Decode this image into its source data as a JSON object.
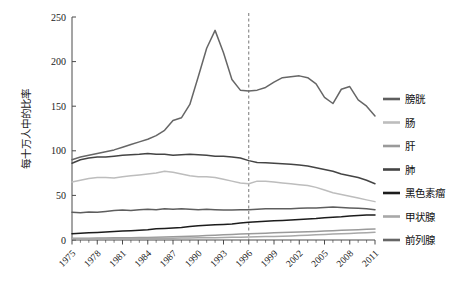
{
  "chart_data": {
    "type": "line",
    "title": "",
    "xlabel": "",
    "ylabel": "每十万人中的比率",
    "xlim": [
      1975,
      2011
    ],
    "ylim": [
      0,
      250
    ],
    "yticks": [
      0,
      50,
      100,
      150,
      200,
      250
    ],
    "xticks": [
      1975,
      1978,
      1981,
      1984,
      1987,
      1990,
      1993,
      1996,
      1999,
      2002,
      2005,
      2008,
      2011
    ],
    "xticklabels": [
      "1975",
      "1978",
      "1981",
      "1984",
      "1987",
      "1990",
      "1993",
      "1996",
      "1999",
      "2002",
      "2005",
      "2008",
      "2011"
    ],
    "grid": false,
    "legend_position": "right",
    "annotations": [
      {
        "type": "vline",
        "x": 1996,
        "style": "dashed",
        "color": "#777777",
        "label": ""
      }
    ],
    "x": [
      1975,
      1976,
      1977,
      1978,
      1979,
      1980,
      1981,
      1982,
      1983,
      1984,
      1985,
      1986,
      1987,
      1988,
      1989,
      1990,
      1991,
      1992,
      1993,
      1994,
      1995,
      1996,
      1997,
      1998,
      1999,
      2000,
      2001,
      2002,
      2003,
      2004,
      2005,
      2006,
      2007,
      2008,
      2009,
      2010,
      2011
    ],
    "series": [
      {
        "name": "膀胱",
        "color": "#5e5e5e",
        "values": [
          31,
          30.5,
          31.5,
          31,
          32,
          33,
          33.5,
          33,
          34,
          34.5,
          34,
          35,
          34.5,
          35,
          34.5,
          34,
          34.5,
          34,
          33.5,
          33.5,
          34,
          34,
          34.5,
          35,
          35,
          35,
          35,
          35.5,
          36,
          36,
          36.5,
          37,
          36.5,
          36,
          35.5,
          35,
          34
        ]
      },
      {
        "name": "肠",
        "color": "#bdbdbd",
        "values": [
          65,
          67,
          69,
          70,
          70,
          69.5,
          71,
          72,
          73,
          74,
          75,
          77,
          76,
          74,
          72,
          71,
          71,
          70,
          68,
          66,
          64,
          63,
          66,
          66,
          65,
          64,
          63,
          62,
          61,
          59,
          56,
          53,
          51,
          49,
          47,
          45,
          43
        ]
      },
      {
        "name": "肝",
        "color": "#9a9a9a",
        "values": [
          2,
          2,
          2.1,
          2.2,
          2.3,
          2.4,
          2.5,
          2.6,
          2.7,
          2.9,
          3.1,
          3.3,
          3.6,
          3.9,
          4.2,
          4.6,
          5,
          5.4,
          5.8,
          6.2,
          6.6,
          7,
          7.4,
          7.7,
          8,
          8.3,
          8.6,
          8.9,
          9.2,
          9.6,
          10,
          10.4,
          10.8,
          11.2,
          11.6,
          12,
          12.4
        ]
      },
      {
        "name": "肺",
        "color": "#444444",
        "values": [
          86,
          90,
          92,
          93,
          93,
          94,
          95,
          95.5,
          96,
          97,
          96,
          96,
          95,
          95.5,
          96,
          95.5,
          95,
          94,
          94,
          93,
          92,
          89,
          87,
          86.5,
          86,
          85.5,
          85,
          84,
          83,
          81,
          79,
          77,
          74,
          72,
          70,
          67,
          63
        ]
      },
      {
        "name": "黑色素瘤",
        "color": "#1c1c1c",
        "values": [
          7,
          7.5,
          8,
          8.5,
          9,
          9.5,
          10,
          10.5,
          11,
          11.5,
          12.5,
          13,
          13.5,
          14,
          15,
          16,
          16.5,
          17,
          17.5,
          18,
          19,
          20,
          20.5,
          21,
          21.5,
          22,
          22.5,
          23,
          23.5,
          24,
          25,
          25.5,
          26,
          27,
          27.5,
          28,
          28
        ]
      },
      {
        "name": "甲状腺",
        "color": "#a8a8a8",
        "values": [
          1.4,
          1.4,
          1.5,
          1.5,
          1.6,
          1.6,
          1.7,
          1.7,
          1.8,
          1.8,
          1.9,
          2,
          2.1,
          2.2,
          2.3,
          2.4,
          2.5,
          2.6,
          2.8,
          3,
          3.2,
          3.4,
          3.6,
          3.8,
          4,
          4.3,
          4.6,
          5,
          5.4,
          5.8,
          6.2,
          6.6,
          7,
          7.4,
          7.8,
          8.2,
          8.6
        ]
      },
      {
        "name": "前列腺",
        "color": "#666666",
        "values": [
          90,
          93,
          95,
          97,
          99,
          101,
          104,
          107,
          110,
          113,
          117,
          123,
          134,
          137,
          152,
          183,
          215,
          235,
          210,
          180,
          168,
          167,
          168,
          171,
          177,
          182,
          183,
          184,
          182,
          175,
          160,
          153,
          169,
          172,
          157,
          150,
          139
        ]
      }
    ]
  },
  "legend": {
    "items": [
      {
        "label": "膀胱",
        "color": "#5e5e5e"
      },
      {
        "label": "肠",
        "color": "#bdbdbd"
      },
      {
        "label": "肝",
        "color": "#9a9a9a"
      },
      {
        "label": "肺",
        "color": "#444444"
      },
      {
        "label": "黑色素瘤",
        "color": "#1c1c1c"
      },
      {
        "label": "甲状腺",
        "color": "#a8a8a8"
      },
      {
        "label": "前列腺",
        "color": "#666666"
      }
    ]
  },
  "axes": {
    "y_title": "每十万人中的比率",
    "y_tick_labels": [
      "0",
      "50",
      "100",
      "150",
      "200",
      "250"
    ],
    "x_tick_labels": [
      "1975",
      "1978",
      "1981",
      "1984",
      "1987",
      "1990",
      "1993",
      "1996",
      "1999",
      "2002",
      "2005",
      "2008",
      "2011"
    ]
  }
}
